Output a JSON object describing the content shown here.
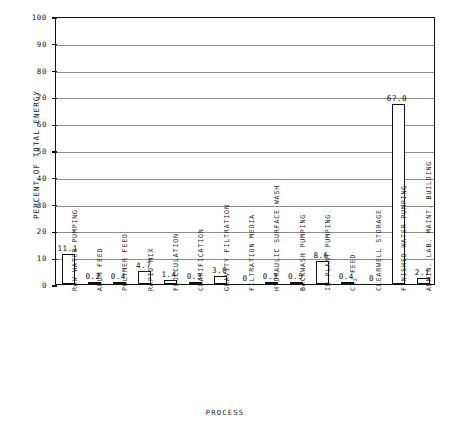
{
  "chart_data": {
    "type": "bar",
    "title": "",
    "xlabel": "PROCESS",
    "ylabel": "PERCENT OF TOTAL ENERGY",
    "ylim": [
      0,
      100
    ],
    "yticks": [
      0,
      10,
      20,
      30,
      40,
      50,
      60,
      70,
      80,
      90,
      100
    ],
    "grid": true,
    "legend": "none",
    "categories": [
      "RAW WATER PUMPING",
      "ALUM FEED",
      "POLYMER FEED",
      "RAPID MIX",
      "FLOCCULATION",
      "CLARIFICATION",
      "GRAVITY FILTRATION",
      "FILTRATION MEDIA",
      "HYDRAULIC SURFACE WASH",
      "BACKWASH PUMPING",
      "IN-PLANT PUMPING",
      "Cl2 FEED",
      "CLEARWELL STORAGE",
      "FINISHED WATER PUMPING",
      "ADMIN. LAB. MAINT. BUILDING"
    ],
    "values": [
      11.1,
      0.2,
      0.4,
      4.7,
      1.4,
      0.3,
      3.0,
      0,
      0.3,
      0.5,
      8.6,
      0.4,
      0,
      67.0,
      2.1
    ],
    "value_labels": [
      "11.1",
      "0.2",
      "0.4",
      "4.7",
      "1.4",
      "0.3",
      "3.0",
      "0",
      "0.3",
      "0.5",
      "8.6",
      "0.4",
      "0",
      "67.0",
      "2.1"
    ],
    "bar_facecolor": "#ffffff",
    "bar_edgecolor": "#111111",
    "grid_color": "#8d8d8d",
    "axis_color": "#111111"
  }
}
